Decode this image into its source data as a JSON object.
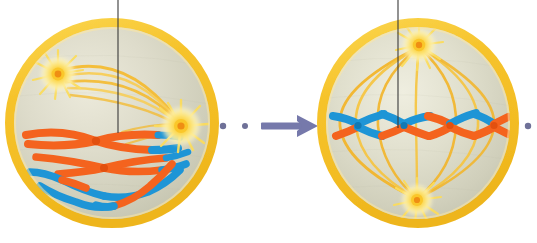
{
  "figure": {
    "caption": "",
    "background_color": "#ffffff",
    "width": 537,
    "height": 243
  },
  "palette": {
    "membrane_outer": "#f6c32b",
    "membrane_mid": "#fcd54d",
    "membrane_highlight": "#fde99a",
    "cytoplasm_light": "#e4e2d2",
    "cytoplasm_mid": "#d6d5c2",
    "cytoplasm_shadow": "#c6c6b2",
    "spindle_fiber": "#f2b52a",
    "spindle_fiber_light": "#f9d469",
    "centrosome_core": "#ef8e13",
    "centrosome_mid": "#fbd430",
    "centrosome_glow": "#fdf0a8",
    "chromosome_orange": "#f4631e",
    "chromosome_orange_dark": "#e2500f",
    "chromosome_blue": "#1e95d6",
    "chromosome_blue_dark": "#1279b4",
    "arrow": "#7679ab",
    "dot": "#6f7198",
    "leader_line": "#3a3a3a"
  },
  "cells": [
    {
      "id": "cell-left",
      "stage_name": "prometaphase",
      "center_x": 112,
      "center_y": 123,
      "radius_x": 103,
      "radius_y": 101,
      "membrane_thickness": 9,
      "centrosomes": [
        {
          "id": "centrosome-left-upper",
          "x": 58,
          "y": 74,
          "radius": 17
        },
        {
          "id": "centrosome-left-right",
          "x": 181,
          "y": 126,
          "radius": 19
        }
      ],
      "chromosome_count": 4,
      "chromosomes": [
        {
          "id": "chromosome-1",
          "shape": "x-shaped",
          "colors": [
            "#f4631e",
            "#1e95d6"
          ]
        },
        {
          "id": "chromosome-2",
          "shape": "x-shaped",
          "colors": [
            "#f4631e",
            "#1e95d6"
          ]
        },
        {
          "id": "chromosome-3",
          "shape": "curved-strand",
          "colors": [
            "#1e95d6",
            "#f4631e"
          ]
        },
        {
          "id": "chromosome-4",
          "shape": "curved-strand",
          "colors": [
            "#1e95d6",
            "#f4631e"
          ]
        }
      ],
      "spindle_fiber_count": 5,
      "leader_line": {
        "x": 118,
        "y_top": 0,
        "y_bottom": 133
      }
    },
    {
      "id": "cell-right",
      "stage_name": "metaphase",
      "center_x": 418,
      "center_y": 123,
      "radius_x": 97,
      "radius_y": 101,
      "membrane_thickness": 9,
      "centrosomes": [
        {
          "id": "centrosome-right-top",
          "x": 419,
          "y": 45,
          "radius": 16
        },
        {
          "id": "centrosome-right-bottom",
          "x": 417,
          "y": 200,
          "radius": 15
        }
      ],
      "chromosome_count": 4,
      "chromosomes": [
        {
          "id": "chromosome-1",
          "shape": "x-shaped",
          "colors": [
            "#1e95d6",
            "#f4631e"
          ]
        },
        {
          "id": "chromosome-2",
          "shape": "x-shaped",
          "colors": [
            "#1e95d6",
            "#f4631e"
          ]
        },
        {
          "id": "chromosome-3",
          "shape": "x-shaped",
          "colors": [
            "#1e95d6",
            "#f4631e"
          ]
        },
        {
          "id": "chromosome-4",
          "shape": "x-shaped",
          "colors": [
            "#f4631e",
            "#1e95d6"
          ]
        }
      ],
      "spindle_fiber_count": 7,
      "metaphase_plate_y": 126,
      "leader_line": {
        "x": 398,
        "y_top": 0,
        "y_bottom": 128
      }
    }
  ],
  "connector": {
    "id": "stage-connector",
    "dots": [
      {
        "cx": 223,
        "cy": 126,
        "r": 3.2
      },
      {
        "cx": 245,
        "cy": 126,
        "r": 3.0
      }
    ],
    "arrow": {
      "x_start": 261,
      "x_end": 316,
      "y": 126,
      "shaft_thickness": 7,
      "head_width": 17,
      "head_height": 22
    }
  },
  "edge_markers": [
    {
      "id": "edge-dot-right",
      "cx": 528,
      "cy": 126,
      "r": 3.2
    }
  ]
}
